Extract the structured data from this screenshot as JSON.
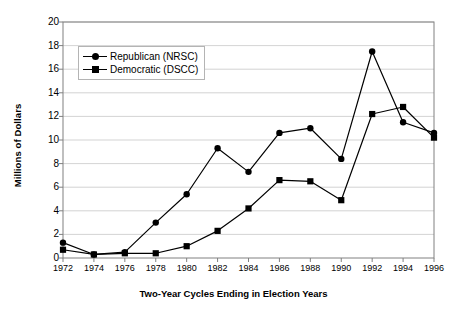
{
  "chart_data": {
    "type": "line",
    "title": "",
    "xlabel": "Two-Year Cycles Ending in Election Years",
    "ylabel": "Millions of Dollars",
    "categories": [
      1972,
      1974,
      1976,
      1978,
      1980,
      1982,
      1984,
      1986,
      1988,
      1990,
      1992,
      1994,
      1996
    ],
    "xtick_labels": [
      "1972",
      "1974",
      "1976",
      "1978",
      "1980",
      "1982",
      "1984",
      "1986",
      "1988",
      "1990",
      "1992",
      "1994",
      "1996"
    ],
    "ylim": [
      0,
      20
    ],
    "yticks": [
      0,
      2,
      4,
      6,
      8,
      10,
      12,
      14,
      16,
      18,
      20
    ],
    "ytick_labels": [
      "0",
      "2",
      "4",
      "6",
      "8",
      "10",
      "12",
      "14",
      "16",
      "18",
      "20"
    ],
    "grid": "horizontal",
    "legend_position": "upper-left-inside",
    "series": [
      {
        "name": "Republican (NRSC)",
        "marker": "circle",
        "color": "#000000",
        "values": [
          1.3,
          0.3,
          0.5,
          3.0,
          5.4,
          9.3,
          7.3,
          10.6,
          11.0,
          8.4,
          17.5,
          11.5,
          10.6
        ]
      },
      {
        "name": "Democratic (DSCC)",
        "marker": "square",
        "color": "#000000",
        "values": [
          0.7,
          0.3,
          0.4,
          0.4,
          1.0,
          2.3,
          4.2,
          6.6,
          6.5,
          4.9,
          12.2,
          12.8,
          10.2
        ]
      }
    ]
  },
  "style": {
    "plot_bg": "#ffffff",
    "grid_color": "#c8c8c8",
    "axis_color": "#808080",
    "series_color": "#000000"
  }
}
